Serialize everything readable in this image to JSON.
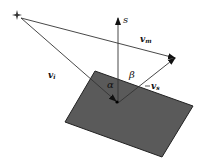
{
  "diagram": {
    "type": "reflection-geometry",
    "colors": {
      "surface_fill": "#5a5a5a",
      "surface_stroke": "#222222",
      "line": "#333333",
      "background": "#ffffff"
    },
    "labels": {
      "normal": "s",
      "mirror_vector": "v",
      "mirror_sub": "m",
      "incident_vector": "v",
      "incident_sub": "i",
      "reflected_vector": "v",
      "reflected_sub": "s",
      "angle_incident": "α",
      "angle_reflected": "β",
      "source_marker": "+"
    },
    "elements": [
      {
        "name": "light-source",
        "shape": "star",
        "x": 16,
        "y": 15
      },
      {
        "name": "surface-plane",
        "points": [
          [
            95,
            71
          ],
          [
            193,
            106
          ],
          [
            162,
            157
          ],
          [
            65,
            122
          ]
        ]
      },
      {
        "name": "normal-s",
        "from": [
          118,
          103
        ],
        "to": [
          118,
          18
        ]
      },
      {
        "name": "vector-vi",
        "from": [
          20,
          18
        ],
        "to": [
          118,
          103
        ]
      },
      {
        "name": "vector-vm",
        "from": [
          20,
          18
        ],
        "to": [
          176,
          58
        ]
      },
      {
        "name": "vector-vs",
        "from": [
          118,
          103
        ],
        "to": [
          176,
          58
        ]
      }
    ]
  }
}
